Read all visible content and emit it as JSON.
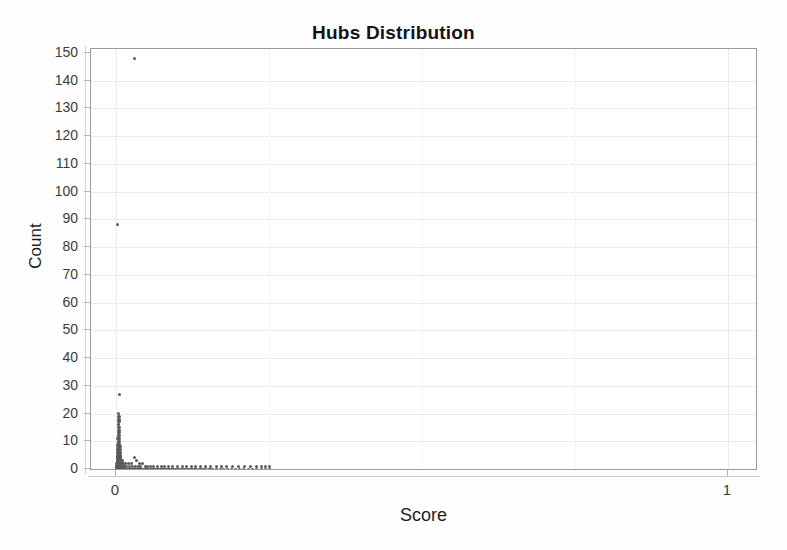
{
  "chart_data": {
    "type": "scatter",
    "title": "Hubs Distribution",
    "xlabel": "Score",
    "ylabel": "Count",
    "xlim": [
      0,
      1
    ],
    "ylim": [
      0,
      150
    ],
    "grid": true,
    "legend": null,
    "legend_position": "none",
    "xticks": [
      0,
      1
    ],
    "xtick_labels": [
      "0",
      "1"
    ],
    "yticks": [
      0,
      10,
      20,
      30,
      40,
      50,
      60,
      70,
      80,
      90,
      100,
      110,
      120,
      130,
      140,
      150
    ],
    "ytick_labels": [
      "0",
      "10",
      "20",
      "30",
      "40",
      "50",
      "60",
      "70",
      "80",
      "90",
      "100",
      "110",
      "120",
      "130",
      "140",
      "150"
    ],
    "marker_color": "#5a5a5a",
    "marker_size_px": 3,
    "annotations": [
      {
        "label": "peak outlier",
        "x": 0.03,
        "y": 148
      },
      {
        "label": "secondary outlier",
        "x": 0.002,
        "y": 88
      },
      {
        "label": "tertiary outlier",
        "x": 0.006,
        "y": 27
      }
    ],
    "points": [
      [
        0.03,
        148
      ],
      [
        0.002,
        88
      ],
      [
        0.006,
        27
      ],
      [
        0.0045,
        20
      ],
      [
        0.005,
        19
      ],
      [
        0.0042,
        19
      ],
      [
        0.0055,
        18
      ],
      [
        0.0048,
        18
      ],
      [
        0.004,
        17
      ],
      [
        0.0052,
        17
      ],
      [
        0.0046,
        16
      ],
      [
        0.0038,
        16
      ],
      [
        0.0058,
        15
      ],
      [
        0.0044,
        15
      ],
      [
        0.0036,
        14
      ],
      [
        0.005,
        14
      ],
      [
        0.006,
        13
      ],
      [
        0.0042,
        13
      ],
      [
        0.0034,
        12
      ],
      [
        0.0054,
        12
      ],
      [
        0.0046,
        12
      ],
      [
        0.0062,
        11
      ],
      [
        0.0038,
        11
      ],
      [
        0.0032,
        11
      ],
      [
        0.0056,
        10
      ],
      [
        0.0048,
        10
      ],
      [
        0.004,
        10
      ],
      [
        0.0064,
        9
      ],
      [
        0.0036,
        9
      ],
      [
        0.003,
        9
      ],
      [
        0.0052,
        9
      ],
      [
        0.0044,
        8
      ],
      [
        0.0066,
        8
      ],
      [
        0.0034,
        8
      ],
      [
        0.0028,
        8
      ],
      [
        0.0058,
        8
      ],
      [
        0.0048,
        7
      ],
      [
        0.004,
        7
      ],
      [
        0.0068,
        7
      ],
      [
        0.0032,
        7
      ],
      [
        0.0026,
        7
      ],
      [
        0.006,
        7
      ],
      [
        0.0052,
        6
      ],
      [
        0.0044,
        6
      ],
      [
        0.007,
        6
      ],
      [
        0.0036,
        6
      ],
      [
        0.003,
        6
      ],
      [
        0.0024,
        6
      ],
      [
        0.0064,
        6
      ],
      [
        0.0056,
        5
      ],
      [
        0.0048,
        5
      ],
      [
        0.0074,
        5
      ],
      [
        0.004,
        5
      ],
      [
        0.0034,
        5
      ],
      [
        0.0028,
        5
      ],
      [
        0.0022,
        5
      ],
      [
        0.0068,
        5
      ],
      [
        0.006,
        5
      ],
      [
        0.0052,
        4
      ],
      [
        0.008,
        4
      ],
      [
        0.0044,
        4
      ],
      [
        0.0038,
        4
      ],
      [
        0.0032,
        4
      ],
      [
        0.0026,
        4
      ],
      [
        0.002,
        4
      ],
      [
        0.0072,
        4
      ],
      [
        0.0064,
        4
      ],
      [
        0.03,
        4
      ],
      [
        0.0056,
        3
      ],
      [
        0.0088,
        3
      ],
      [
        0.0048,
        3
      ],
      [
        0.0042,
        3
      ],
      [
        0.0036,
        3
      ],
      [
        0.003,
        3
      ],
      [
        0.0024,
        3
      ],
      [
        0.0018,
        3
      ],
      [
        0.0078,
        3
      ],
      [
        0.0068,
        3
      ],
      [
        0.034,
        3
      ],
      [
        0.01,
        3
      ],
      [
        0.006,
        2
      ],
      [
        0.0096,
        2
      ],
      [
        0.0052,
        2
      ],
      [
        0.0046,
        2
      ],
      [
        0.004,
        2
      ],
      [
        0.0034,
        2
      ],
      [
        0.0028,
        2
      ],
      [
        0.0022,
        2
      ],
      [
        0.0016,
        2
      ],
      [
        0.0084,
        2
      ],
      [
        0.0074,
        2
      ],
      [
        0.011,
        2
      ],
      [
        0.013,
        2
      ],
      [
        0.016,
        2
      ],
      [
        0.02,
        2
      ],
      [
        0.025,
        2
      ],
      [
        0.038,
        2
      ],
      [
        0.044,
        2
      ],
      [
        0.0064,
        1
      ],
      [
        0.0104,
        1
      ],
      [
        0.0056,
        1
      ],
      [
        0.005,
        1
      ],
      [
        0.0044,
        1
      ],
      [
        0.0038,
        1
      ],
      [
        0.0032,
        1
      ],
      [
        0.0026,
        1
      ],
      [
        0.002,
        1
      ],
      [
        0.0014,
        1
      ],
      [
        0.009,
        1
      ],
      [
        0.008,
        1
      ],
      [
        0.012,
        1
      ],
      [
        0.014,
        1
      ],
      [
        0.0175,
        1
      ],
      [
        0.022,
        1
      ],
      [
        0.027,
        1
      ],
      [
        0.032,
        1
      ],
      [
        0.036,
        1
      ],
      [
        0.04,
        1
      ],
      [
        0.048,
        1
      ],
      [
        0.052,
        1
      ],
      [
        0.057,
        1
      ],
      [
        0.062,
        1
      ],
      [
        0.068,
        1
      ],
      [
        0.001,
        1
      ],
      [
        0.0012,
        1
      ],
      [
        0.0008,
        1
      ],
      [
        0.0006,
        1
      ],
      [
        0.0004,
        1
      ],
      [
        0.074,
        1
      ],
      [
        0.08,
        1
      ],
      [
        0.086,
        1
      ],
      [
        0.093,
        1
      ],
      [
        0.1,
        1
      ],
      [
        0.108,
        1
      ],
      [
        0.115,
        1
      ],
      [
        0.123,
        1
      ],
      [
        0.13,
        1
      ],
      [
        0.138,
        1
      ],
      [
        0.146,
        1
      ],
      [
        0.155,
        1
      ],
      [
        0.164,
        1
      ],
      [
        0.172,
        1
      ],
      [
        0.18,
        1
      ],
      [
        0.19,
        1
      ],
      [
        0.2,
        1
      ],
      [
        0.21,
        1
      ],
      [
        0.22,
        1
      ],
      [
        0.23,
        1
      ],
      [
        0.238,
        1
      ],
      [
        0.245,
        1
      ],
      [
        0.25,
        1
      ],
      [
        0.0018,
        0
      ],
      [
        0.0024,
        0
      ],
      [
        0.003,
        0
      ],
      [
        0.0036,
        0
      ],
      [
        0.0042,
        0
      ],
      [
        0.0048,
        0
      ],
      [
        0.0054,
        0
      ],
      [
        0.006,
        0
      ],
      [
        0.0066,
        0
      ],
      [
        0.0072,
        0
      ],
      [
        0.0078,
        0
      ],
      [
        0.0085,
        0
      ],
      [
        0.0092,
        0
      ],
      [
        0.01,
        0
      ],
      [
        0.0108,
        0
      ],
      [
        0.0116,
        0
      ],
      [
        0.0125,
        0
      ],
      [
        0.0134,
        0
      ],
      [
        0.0143,
        0
      ],
      [
        0.0152,
        0
      ],
      [
        0.0162,
        0
      ],
      [
        0.0172,
        0
      ],
      [
        0.0182,
        0
      ],
      [
        0.0193,
        0
      ],
      [
        0.0204,
        0
      ],
      [
        0.0216,
        0
      ],
      [
        0.0228,
        0
      ],
      [
        0.024,
        0
      ],
      [
        0.0253,
        0
      ],
      [
        0.0266,
        0
      ],
      [
        0.028,
        0
      ],
      [
        0.0294,
        0
      ],
      [
        0.0308,
        0
      ],
      [
        0.0323,
        0
      ],
      [
        0.0338,
        0
      ],
      [
        0.0354,
        0
      ],
      [
        0.037,
        0
      ],
      [
        0.0387,
        0
      ],
      [
        0.0404,
        0
      ],
      [
        0.0422,
        0
      ],
      [
        0.044,
        0
      ],
      [
        0.0459,
        0
      ],
      [
        0.0478,
        0
      ],
      [
        0.0498,
        0
      ],
      [
        0.0518,
        0
      ],
      [
        0.0539,
        0
      ],
      [
        0.056,
        0
      ],
      [
        0.0582,
        0
      ],
      [
        0.0604,
        0
      ],
      [
        0.0627,
        0
      ],
      [
        0.065,
        0
      ],
      [
        0.0674,
        0
      ],
      [
        0.0698,
        0
      ],
      [
        0.0723,
        0
      ],
      [
        0.0748,
        0
      ],
      [
        0.0774,
        0
      ],
      [
        0.08,
        0
      ],
      [
        0.0827,
        0
      ],
      [
        0.0854,
        0
      ],
      [
        0.0882,
        0
      ],
      [
        0.091,
        0
      ],
      [
        0.0939,
        0
      ],
      [
        0.0968,
        0
      ],
      [
        0.0998,
        0
      ],
      [
        0.1028,
        0
      ],
      [
        0.1059,
        0
      ],
      [
        0.109,
        0
      ],
      [
        0.1122,
        0
      ],
      [
        0.1154,
        0
      ],
      [
        0.1187,
        0
      ],
      [
        0.122,
        0
      ],
      [
        0.1254,
        0
      ],
      [
        0.1288,
        0
      ],
      [
        0.1323,
        0
      ],
      [
        0.1358,
        0
      ],
      [
        0.1394,
        0
      ],
      [
        0.143,
        0
      ],
      [
        0.1467,
        0
      ],
      [
        0.1504,
        0
      ],
      [
        0.1542,
        0
      ],
      [
        0.158,
        0
      ],
      [
        0.164,
        0
      ],
      [
        0.17,
        0
      ],
      [
        0.176,
        0
      ],
      [
        0.182,
        0
      ],
      [
        0.188,
        0
      ],
      [
        0.195,
        0
      ],
      [
        0.202,
        0
      ],
      [
        0.209,
        0
      ],
      [
        0.216,
        0
      ],
      [
        0.223,
        0
      ],
      [
        0.23,
        0
      ],
      [
        0.237,
        0
      ],
      [
        0.244,
        0
      ],
      [
        0.251,
        0
      ],
      [
        0.0012,
        0
      ],
      [
        0.0008,
        0
      ],
      [
        0.0005,
        0
      ],
      [
        0.0003,
        0
      ],
      [
        0.0002,
        0
      ]
    ]
  }
}
